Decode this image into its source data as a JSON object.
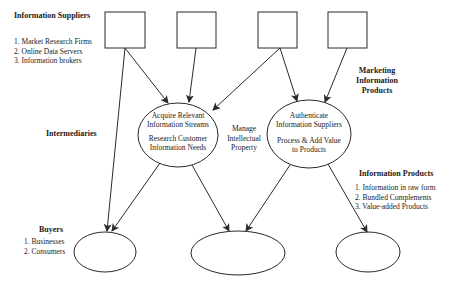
{
  "labels": {
    "suppliers": {
      "title": "Information Suppliers",
      "items": [
        "1. Market Research Firms",
        "2. Online Data Servers",
        "3. Information brokers"
      ]
    },
    "marketing": {
      "line1": "Marketing",
      "line2": "Information",
      "line3": "Products"
    },
    "intermediaries": "Intermediaries",
    "manage_ip": {
      "line1": "Manage",
      "line2": "Intellectual",
      "line3": "Property"
    },
    "info_products": {
      "title": "Information Products",
      "items": [
        "1. Information in raw form",
        "2. Bundled Complements",
        "3. Value-added  Products"
      ]
    },
    "buyers": {
      "title": "Buyers",
      "items": [
        "1.  Businesses",
        "2.  Consumers"
      ]
    }
  },
  "nodes": {
    "acquire": {
      "line1": "Acquire Relevant",
      "line2": "Information Streams",
      "line3": "Research Customer",
      "line4": "Information Needs"
    },
    "authenticate": {
      "line1": "Authenticate",
      "line2": "Information Suppliers",
      "line3": "Process & Add Value",
      "line4": "to Products"
    }
  },
  "colors": {
    "stroke": "#2a2a2a",
    "background": "#ffffff"
  }
}
